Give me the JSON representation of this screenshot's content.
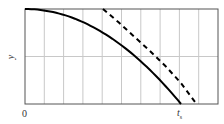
{
  "chart_data": {
    "type": "line",
    "title": "",
    "xlabel": "",
    "ylabel": "y",
    "x_tick_labels": [
      "0",
      "t_s"
    ],
    "x_tick_display": {
      "zero": "0",
      "ts_main": "t",
      "ts_sub": "s"
    },
    "xlim": [
      0,
      1.2
    ],
    "ylim": [
      0,
      1
    ],
    "grid": {
      "vertical_lines": 9,
      "horizontal_lines": 1,
      "on": true
    },
    "legend": null,
    "series": [
      {
        "name": "solid-curve",
        "style": "solid",
        "color": "#000000",
        "x": [
          0,
          0.1,
          0.2,
          0.3,
          0.4,
          0.5,
          0.6,
          0.7,
          0.8,
          0.9,
          1.0
        ],
        "y": [
          1.0,
          0.99,
          0.96,
          0.91,
          0.84,
          0.75,
          0.64,
          0.51,
          0.36,
          0.19,
          0.0
        ]
      },
      {
        "name": "dashed-curve",
        "style": "dashed",
        "color": "#000000",
        "x": [
          0.5,
          0.6,
          0.7,
          0.8,
          0.9,
          1.0,
          1.1
        ],
        "y": [
          1.0,
          0.86,
          0.71,
          0.56,
          0.4,
          0.22,
          0.0
        ]
      }
    ]
  },
  "colors": {
    "grid": "#c8c8c8",
    "axis": "#555555",
    "curve": "#000000",
    "background": "#ffffff"
  }
}
